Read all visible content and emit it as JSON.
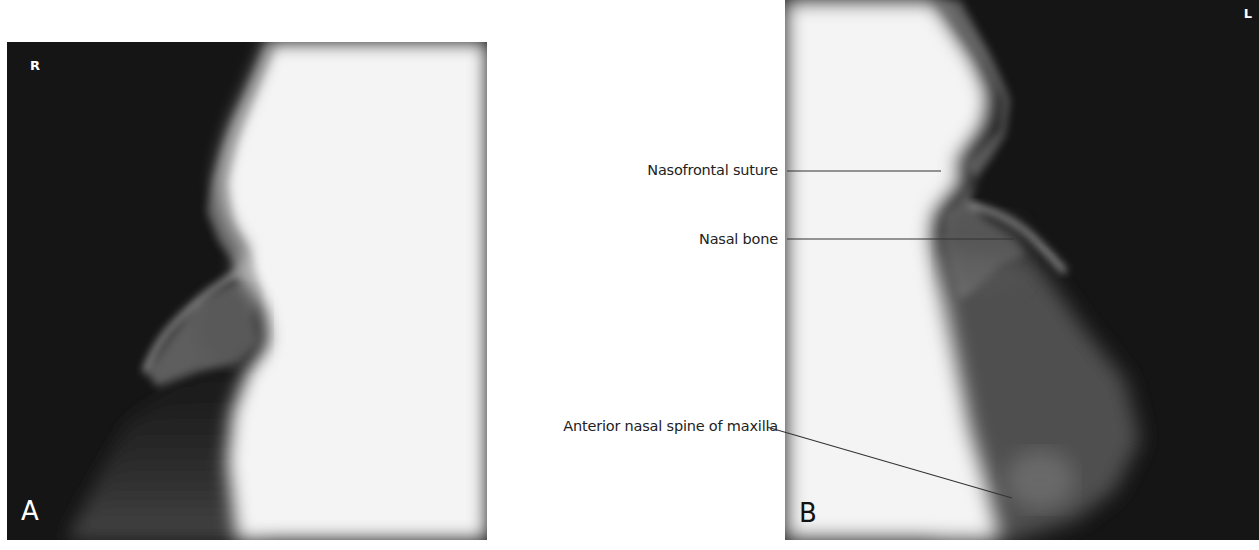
{
  "figure": {
    "panels": [
      {
        "id": "A",
        "panel_letter": "A",
        "side_marker": "R",
        "description": "Lateral radiograph of nasal bones, facing left (right side)"
      },
      {
        "id": "B",
        "panel_letter": "B",
        "side_marker": "L",
        "description": "Lateral radiograph of nasal bones, facing right (left side)"
      }
    ],
    "annotations": [
      {
        "label": "Nasofrontal suture"
      },
      {
        "label": "Nasal bone"
      },
      {
        "label": "Anterior nasal spine of maxilla"
      }
    ],
    "colors": {
      "background": "#ffffff",
      "radiograph_dark": "#151515",
      "radiograph_light": "#f4f4f4",
      "label_text": "#222222",
      "leader_line": "#333333"
    }
  }
}
